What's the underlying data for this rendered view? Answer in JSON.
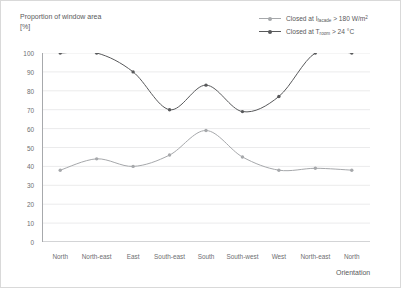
{
  "chart_data": {
    "type": "line",
    "title": "",
    "ylabel_line1": "Proportion of window area",
    "ylabel_line2": "[%]",
    "xlabel": "Orientation",
    "categories": [
      "North",
      "North-east",
      "East",
      "South-east",
      "South",
      "South-west",
      "West",
      "North-east",
      "North"
    ],
    "ylim": [
      0,
      100
    ],
    "yticks": [
      0,
      10,
      20,
      30,
      40,
      50,
      60,
      70,
      80,
      90,
      100
    ],
    "ytick_labels": [
      "0",
      "10",
      "20",
      "30",
      "40",
      "50",
      "60",
      "70",
      "80",
      "90",
      "100"
    ],
    "grid": true,
    "legend_position": "top-right",
    "series": [
      {
        "name": "Closed at I_facade > 180 W/m2",
        "label_prefix": "Closed at ",
        "label_symbol": "I",
        "label_subscript": "facade",
        "label_suffix": " > 180 W/m",
        "label_superscript": "2",
        "color": "#a6a8ab",
        "values": [
          38,
          44,
          40,
          46,
          59,
          45,
          38,
          39,
          38
        ]
      },
      {
        "name": "Closed at T_room > 24 C",
        "label_prefix": "Closed at ",
        "label_symbol": "T",
        "label_subscript": "room",
        "label_suffix": " > 24 °C",
        "label_superscript": "",
        "color": "#58595b",
        "values": [
          100,
          100,
          90,
          70,
          83,
          69,
          77,
          100,
          100
        ]
      }
    ]
  },
  "colors": {
    "axis": "#a7a9ac",
    "grid": "#ebebec",
    "text": "#58595b",
    "tick_text": "#6d6e71",
    "frame": "#d9d9d9",
    "series_light": "#a6a8ab",
    "series_dark": "#58595b"
  }
}
